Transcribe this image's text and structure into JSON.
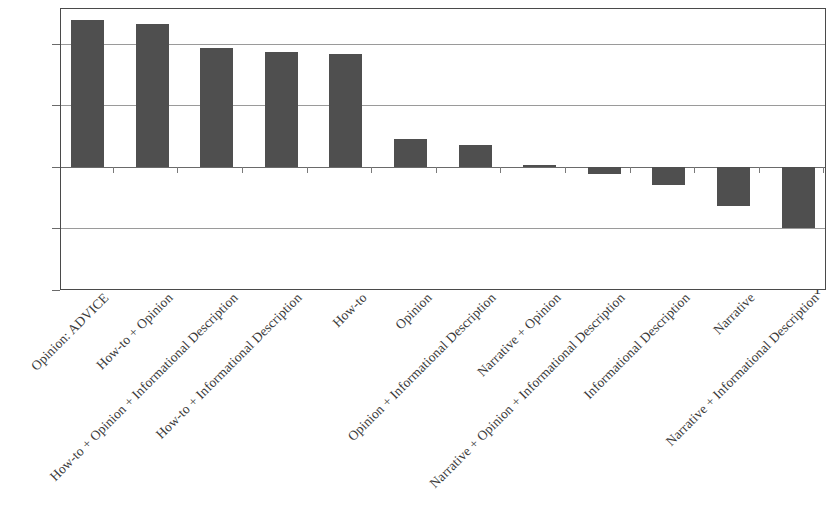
{
  "chart_data": {
    "type": "bar",
    "title": "",
    "subtitle": "",
    "xlabel": "",
    "ylabel": "",
    "ylim": [
      -1,
      1.25
    ],
    "yticks": [
      1,
      0.5,
      0,
      -0.5,
      -1
    ],
    "ytick_labels": [
      "1",
      "0.5",
      "0",
      "−0.5",
      "−1"
    ],
    "grid": true,
    "legend": false,
    "legend_position": "none",
    "bar_color": "#4f4f4f",
    "categories": [
      "Opinion: ADVICE",
      "How-to + Opinion",
      "How-to + Opinion + Informational Description",
      "How-to + Informational Description",
      "How-to",
      "Opinion",
      "Opinion + Informational Description",
      "Narrative + Opinion",
      "Narrative + Opinion + Informational Description",
      "Informational Description",
      "Narrative",
      "Narrative + Informational Description"
    ],
    "values": [
      1.2,
      1.17,
      0.97,
      0.94,
      0.92,
      0.23,
      0.18,
      0.02,
      -0.06,
      -0.15,
      -0.32,
      -0.5
    ]
  }
}
